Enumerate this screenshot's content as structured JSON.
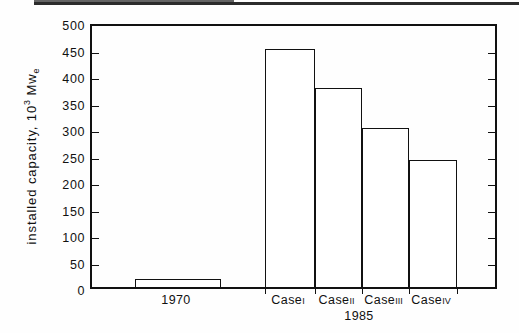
{
  "chart_data": {
    "type": "bar",
    "title": "",
    "xlabel": "",
    "ylabel": "installed capacity, 10^3 Mwe",
    "ylabel_parts": {
      "prefix": "installed capacity,  10",
      "exponent": "3",
      "unit_main": " Mw",
      "unit_sub": "e"
    },
    "ylim": [
      0,
      500
    ],
    "ytick_values": [
      0,
      50,
      100,
      150,
      200,
      250,
      300,
      350,
      400,
      450,
      500
    ],
    "ytick_labels": [
      "0",
      "50",
      "100",
      "150",
      "200",
      "250",
      "300",
      "350",
      "400",
      "450",
      "500"
    ],
    "grid": false,
    "legend": "none",
    "categories": [
      "1970",
      "Case I",
      "Case II",
      "Case III",
      "Case IV"
    ],
    "values": [
      15,
      450,
      375,
      300,
      240
    ],
    "bars": [
      {
        "label": "1970",
        "roman": "",
        "value": 15,
        "x_left_px": 133,
        "x_right_px": 219,
        "group": ""
      },
      {
        "label": "Case",
        "roman": "I",
        "value": 450,
        "x_left_px": 263,
        "x_right_px": 313,
        "group": "1985"
      },
      {
        "label": "Case",
        "roman": "II",
        "value": 375,
        "x_left_px": 313,
        "x_right_px": 360,
        "group": "1985"
      },
      {
        "label": "Case",
        "roman": "III",
        "value": 300,
        "x_left_px": 360,
        "x_right_px": 407,
        "group": "1985"
      },
      {
        "label": "Case",
        "roman": "IV",
        "value": 240,
        "x_left_px": 407,
        "x_right_px": 455,
        "group": "1985"
      }
    ],
    "group_label": "1985",
    "colors": {
      "ink": "#111111",
      "bar_fill": "#ffffff",
      "background": "#ffffff"
    }
  }
}
